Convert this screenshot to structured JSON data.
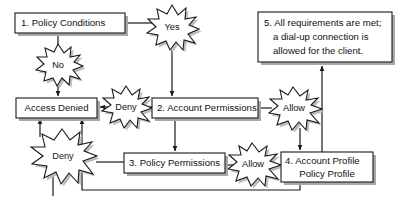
{
  "diagram": {
    "colors": {
      "stroke": "#1a1a1a",
      "fill": "#ffffff",
      "shadow": "#a8a8a8",
      "background": "#ffffff"
    },
    "nodes": [
      {
        "id": "node-1",
        "shape": "rectangle",
        "name": "policy-conditions-box",
        "lines": [
          "1. Policy Conditions"
        ]
      },
      {
        "id": "node-2",
        "shape": "rectangle",
        "name": "account-permissions-box",
        "lines": [
          "2. Account Permissions"
        ]
      },
      {
        "id": "node-3",
        "shape": "rectangle",
        "name": "policy-permissions-box",
        "lines": [
          "3. Policy Permissions"
        ]
      },
      {
        "id": "node-4",
        "shape": "rectangle",
        "name": "account-profile-policy-profile-box",
        "lines": [
          "4. Account Profile",
          "Policy Profile"
        ]
      },
      {
        "id": "node-5",
        "shape": "rectangle",
        "name": "all-requirements-met-box",
        "lines": [
          "5. All requirements are met;",
          "a dial-up connection is",
          "allowed for the client."
        ]
      },
      {
        "id": "node-denied",
        "shape": "rectangle",
        "name": "access-denied-box",
        "lines": [
          "Access Denied"
        ]
      }
    ],
    "bursts": [
      {
        "id": "burst-yes",
        "name": "yes-burst",
        "label": "Yes"
      },
      {
        "id": "burst-no",
        "name": "no-burst",
        "label": "No"
      },
      {
        "id": "burst-deny-1",
        "name": "deny-burst-account",
        "label": "Deny"
      },
      {
        "id": "burst-deny-2",
        "name": "deny-burst-policy",
        "label": "Deny"
      },
      {
        "id": "burst-allow-1",
        "name": "allow-burst-account",
        "label": "Allow"
      },
      {
        "id": "burst-allow-2",
        "name": "allow-burst-policy",
        "label": "Allow"
      }
    ],
    "edges": [
      {
        "name": "edge-policy-conditions-to-yes",
        "from": "node-1",
        "to": "burst-yes"
      },
      {
        "name": "edge-policy-conditions-to-no",
        "from": "node-1",
        "to": "burst-no"
      },
      {
        "name": "edge-no-to-access-denied",
        "from": "burst-no",
        "to": "node-denied"
      },
      {
        "name": "edge-yes-to-account-permissions",
        "from": "burst-yes",
        "to": "node-2"
      },
      {
        "name": "edge-account-permissions-to-deny",
        "from": "node-2",
        "to": "burst-deny-1"
      },
      {
        "name": "edge-deny-to-access-denied",
        "from": "burst-deny-1",
        "to": "node-denied"
      },
      {
        "name": "edge-account-permissions-to-allow",
        "from": "node-2",
        "to": "burst-allow-1"
      },
      {
        "name": "edge-account-permissions-to-policy-permissions",
        "from": "node-2",
        "to": "node-3"
      },
      {
        "name": "edge-policy-permissions-to-deny",
        "from": "node-3",
        "to": "burst-deny-2"
      },
      {
        "name": "edge-deny2-to-access-denied",
        "from": "burst-deny-2",
        "to": "node-denied"
      },
      {
        "name": "edge-policy-permissions-to-allow",
        "from": "node-3",
        "to": "burst-allow-2"
      },
      {
        "name": "edge-allow2-to-account-profile",
        "from": "burst-allow-2",
        "to": "node-4"
      },
      {
        "name": "edge-allow1-to-account-profile",
        "from": "burst-allow-1",
        "to": "node-4"
      },
      {
        "name": "edge-account-profile-to-requirements-met",
        "from": "node-4",
        "to": "node-5"
      },
      {
        "name": "edge-account-profile-to-access-denied",
        "from": "node-4",
        "to": "node-denied"
      }
    ]
  }
}
